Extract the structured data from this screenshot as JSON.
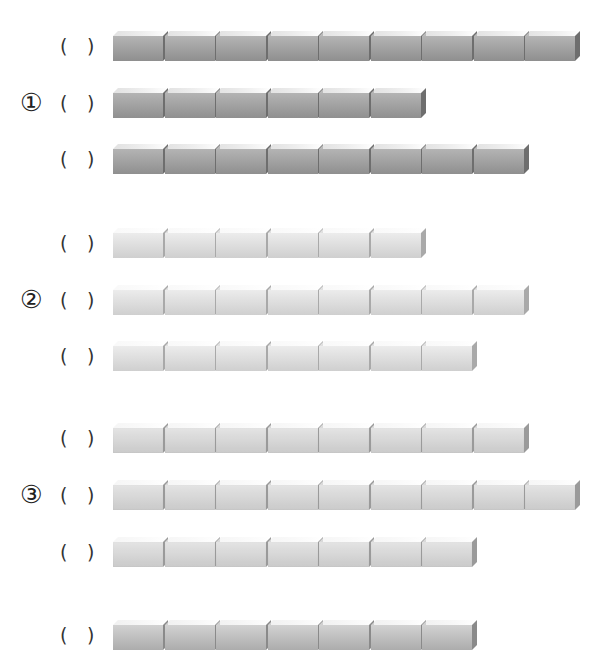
{
  "worksheet": {
    "groups": [
      {
        "label": "①",
        "tone": "dark",
        "rows": [
          {
            "open": "(",
            "answer": "",
            "close": ")",
            "blocks": 9,
            "top": 31
          },
          {
            "open": "(",
            "answer": "",
            "close": ")",
            "blocks": 6,
            "top": 88
          },
          {
            "open": "(",
            "answer": "",
            "close": ")",
            "blocks": 8,
            "top": 144
          }
        ]
      },
      {
        "label": "②",
        "tone": "light",
        "rows": [
          {
            "open": "(",
            "answer": "",
            "close": ")",
            "blocks": 6,
            "top": 228
          },
          {
            "open": "(",
            "answer": "",
            "close": ")",
            "blocks": 8,
            "top": 285
          },
          {
            "open": "(",
            "answer": "",
            "close": ")",
            "blocks": 7,
            "top": 341
          }
        ]
      },
      {
        "label": "③",
        "tone": "striped",
        "rows": [
          {
            "open": "(",
            "answer": "",
            "close": ")",
            "blocks": 8,
            "top": 423
          },
          {
            "open": "(",
            "answer": "",
            "close": ")",
            "blocks": 9,
            "top": 480
          },
          {
            "open": "(",
            "answer": "",
            "close": ")",
            "blocks": 7,
            "top": 537
          }
        ]
      },
      {
        "label": "",
        "tone": "medium",
        "rows": [
          {
            "open": "(",
            "answer": "",
            "close": ")",
            "blocks": 7,
            "top": 620
          }
        ]
      }
    ],
    "tones": {
      "dark": {
        "front_top": "#b4b4b4",
        "front_bottom": "#8f8f8f",
        "top_face": "#d6d6d6",
        "side": "#6e6e6e"
      },
      "light": {
        "front_top": "#ececec",
        "front_bottom": "#cfcfcf",
        "top_face": "#f6f6f6",
        "side": "#a9a9a9"
      },
      "striped": {
        "front_top": "#e2e2e2",
        "front_bottom": "#c6c6c6",
        "top_face": "#f2f2f2",
        "side": "#9a9a9a"
      },
      "medium": {
        "front_top": "#d2d2d2",
        "front_bottom": "#acacac",
        "top_face": "#ebebeb",
        "side": "#8a8a8a"
      }
    }
  }
}
